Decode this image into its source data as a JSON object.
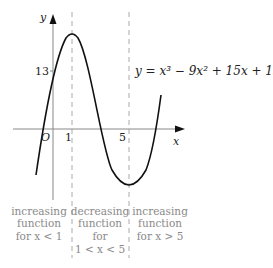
{
  "diagram": {
    "equation": "y = x³ − 9x² + 15x + 13",
    "axes": {
      "x_label": "x",
      "y_label": "y",
      "origin_label": "O",
      "x_ticks": [
        "1",
        "5"
      ],
      "y_ticks": [
        "13"
      ]
    },
    "regions": [
      {
        "line1": "increasing",
        "line2": "function",
        "line3": "for x < 1",
        "line4": ""
      },
      {
        "line1": "decreasing",
        "line2": "function",
        "line3": "for",
        "line4": "1 < x < 5"
      },
      {
        "line1": "increasing",
        "line2": "function",
        "line3": "for x > 5",
        "line4": ""
      }
    ],
    "colors": {
      "curve": "#111111",
      "axis": "#888888",
      "dashed": "#aaaaaa",
      "annotation": "#8a8a8a"
    }
  }
}
